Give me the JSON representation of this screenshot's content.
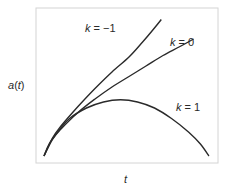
{
  "chart_data": {
    "type": "line",
    "title": "",
    "xlabel": "t",
    "ylabel": "a(t)",
    "grid": false,
    "ticks": "none",
    "frame_color": "#d4d4d4",
    "line_color": "#2a2a2a",
    "series": [
      {
        "name": "k = -1",
        "k": -1,
        "label_pos": [
          85,
          32
        ],
        "points": [
          [
            0,
            0
          ],
          [
            0.05,
            0.12
          ],
          [
            0.1,
            0.2
          ],
          [
            0.2,
            0.33
          ],
          [
            0.3,
            0.45
          ],
          [
            0.4,
            0.56
          ],
          [
            0.5,
            0.66
          ],
          [
            0.58,
            0.76
          ],
          [
            0.64,
            0.84
          ],
          [
            0.69,
            0.91
          ]
        ]
      },
      {
        "name": "k = 0",
        "k": 0,
        "label_pos": [
          170,
          45
        ],
        "points": [
          [
            0,
            0
          ],
          [
            0.05,
            0.11
          ],
          [
            0.1,
            0.18
          ],
          [
            0.2,
            0.29
          ],
          [
            0.3,
            0.38
          ],
          [
            0.4,
            0.46
          ],
          [
            0.5,
            0.53
          ],
          [
            0.6,
            0.6
          ],
          [
            0.7,
            0.67
          ],
          [
            0.8,
            0.73
          ],
          [
            0.88,
            0.78
          ]
        ]
      },
      {
        "name": "k = 1",
        "k": 1,
        "label_pos": [
          176,
          110
        ],
        "points": [
          [
            0,
            0
          ],
          [
            0.03,
            0.08
          ],
          [
            0.08,
            0.16
          ],
          [
            0.15,
            0.25
          ],
          [
            0.25,
            0.32
          ],
          [
            0.35,
            0.36
          ],
          [
            0.45,
            0.375
          ],
          [
            0.55,
            0.36
          ],
          [
            0.65,
            0.32
          ],
          [
            0.75,
            0.25
          ],
          [
            0.85,
            0.16
          ],
          [
            0.92,
            0.08
          ],
          [
            0.97,
            0.0
          ]
        ]
      }
    ],
    "xlim": [
      0,
      1
    ],
    "ylim": [
      0,
      1
    ]
  },
  "labels": {
    "y_axis": "a(t)",
    "x_axis": "t",
    "k_neg1": "k = −1",
    "k_0": "k = 0",
    "k_1": "k = 1"
  }
}
